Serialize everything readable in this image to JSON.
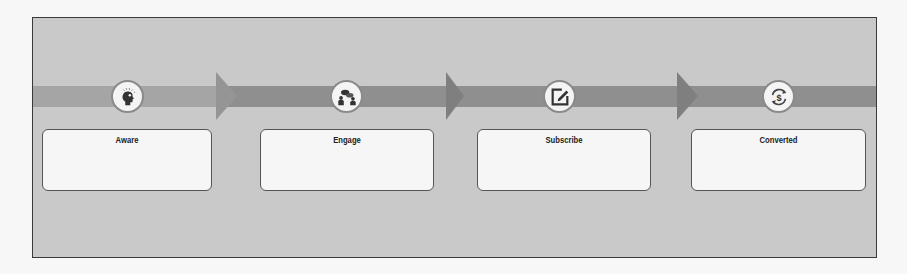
{
  "diagram": {
    "type": "funnel-flow",
    "colors": {
      "panel_background": "#c9c9c9",
      "band_light": "#a3a3a3",
      "band_dark": "#8e8e8e",
      "arrow": "#8a8a8a",
      "box_background": "#f6f6f6",
      "border": "#3a3a3a"
    },
    "stages": [
      {
        "label": "Aware",
        "icon": "head-bulb-icon",
        "description": ""
      },
      {
        "label": "Engage",
        "icon": "conversation-people-icon",
        "description": ""
      },
      {
        "label": "Subscribe",
        "icon": "edit-form-icon",
        "description": ""
      },
      {
        "label": "Converted",
        "icon": "dollar-cycle-icon",
        "description": ""
      }
    ]
  }
}
